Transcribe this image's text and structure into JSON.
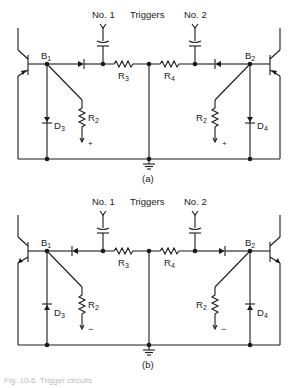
{
  "figure": {
    "triggers_label": "Triggers",
    "trigger_1_label": "No. 1",
    "trigger_2_label": "No. 2",
    "panels": [
      {
        "id": "a",
        "label": "(a)",
        "nodes": {
          "b1": "B",
          "b1_sub": "1",
          "b2": "B",
          "b2_sub": "2"
        },
        "components": {
          "r3": "R",
          "r3_sub": "3",
          "r4": "R",
          "r4_sub": "4",
          "r2_left": "R",
          "r2_left_sub": "2",
          "r2_right": "R",
          "r2_right_sub": "2",
          "d3": "D",
          "d3_sub": "3",
          "d4": "D",
          "d4_sub": "4"
        },
        "bias_polarity": "+",
        "transistor_type": "PNP",
        "steering_diode_direction": "toward-base",
        "clamp_diode_direction": "down"
      },
      {
        "id": "b",
        "label": "(b)",
        "nodes": {
          "b1": "B",
          "b1_sub": "1",
          "b2": "B",
          "b2_sub": "2"
        },
        "components": {
          "r3": "R",
          "r3_sub": "3",
          "r4": "R",
          "r4_sub": "4",
          "r2_left": "R",
          "r2_left_sub": "2",
          "r2_right": "R",
          "r2_right_sub": "2",
          "d3": "D",
          "d3_sub": "3",
          "d4": "D",
          "d4_sub": "4"
        },
        "bias_polarity": "−",
        "transistor_type": "NPN",
        "steering_diode_direction": "away-from-base",
        "clamp_diode_direction": "up"
      }
    ],
    "caption": "Fig. 10-6. Trigger circuits"
  }
}
